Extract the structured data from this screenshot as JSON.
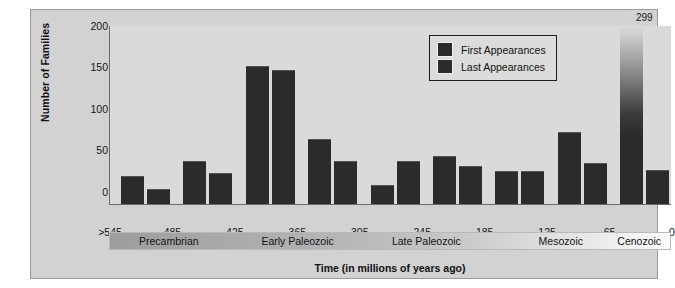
{
  "chart_data": {
    "type": "bar",
    "title": "",
    "xlabel": "Time (in millions of years ago)",
    "ylabel": "Number of Families",
    "ylim": [
      0,
      215
    ],
    "yticks": [
      0,
      50,
      100,
      150,
      200
    ],
    "xticks": [
      ">545",
      "485",
      "425",
      "365",
      "305",
      "245",
      "185",
      "125",
      "65",
      "0"
    ],
    "grid": false,
    "legend_position": "top-right",
    "legend": [
      "First Appearances",
      "Last Appearances"
    ],
    "series": [
      {
        "name": "First Appearances",
        "values": [
          33,
          50,
          165,
          77,
          22,
          56,
          38,
          85,
          299
        ]
      },
      {
        "name": "Last Appearances",
        "values": [
          17,
          36,
          160,
          50,
          50,
          45,
          38,
          48,
          40
        ]
      }
    ],
    "annotations": [
      {
        "text": "299",
        "series": "First Appearances",
        "index": 8,
        "note": "bar clipped; fades at top of axis"
      }
    ],
    "eras": [
      {
        "label": "Precambrian"
      },
      {
        "label": "Early Paleozoic"
      },
      {
        "label": "Late Paleozoic"
      },
      {
        "label": "Mesozoic"
      },
      {
        "label": "Cenozoic"
      }
    ]
  },
  "colors": {
    "bar": "#2b2b2b",
    "panel_background": "#d2d2d2",
    "plot_background": "#dadada",
    "axis": "#6a6a6a",
    "text": "#111111"
  }
}
